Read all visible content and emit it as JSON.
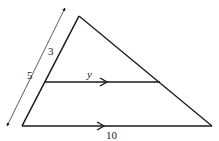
{
  "diagram": {
    "type": "similar-triangles-parallel-lines",
    "colors": {
      "stroke": "#1a1a1a",
      "background": "#ffffff"
    },
    "labels": {
      "upper_segment": "3",
      "full_side": "5",
      "middle_parallel": "y",
      "base": "10"
    },
    "points": {
      "apex": [
        79,
        16
      ],
      "bottom_left": [
        22,
        126
      ],
      "bottom_right": [
        212,
        126
      ],
      "mid_left": [
        45,
        82
      ],
      "mid_right": [
        160,
        82
      ],
      "dim_top": [
        65,
        8
      ],
      "dim_bottom": [
        7,
        126
      ]
    }
  }
}
